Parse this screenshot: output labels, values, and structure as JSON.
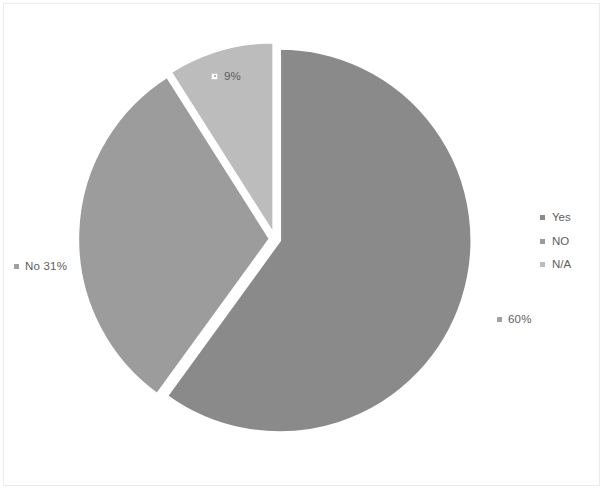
{
  "chart_data": {
    "type": "pie",
    "title": "",
    "categories": [
      "Yes",
      "NO",
      "N/A"
    ],
    "values": [
      60,
      31,
      9
    ],
    "value_unit": "%",
    "data_labels": [
      {
        "text": "60%",
        "category": "Yes",
        "marker": "solid",
        "position": "outside-right"
      },
      {
        "text": "No 31%",
        "category": "NO",
        "marker": "solid",
        "position": "outside-left"
      },
      {
        "text": "9%",
        "category": "N/A",
        "marker": "outline",
        "position": "inside-top"
      }
    ],
    "legend": {
      "position": "right",
      "entries": [
        {
          "label": "Yes",
          "color": "#8a8a8a"
        },
        {
          "label": "NO",
          "color": "#9c9c9c"
        },
        {
          "label": "N/A",
          "color": "#bcbcbc"
        }
      ]
    },
    "slice_colors": [
      "#8a8a8a",
      "#9c9c9c",
      "#bcbcbc"
    ],
    "start_angle": 0,
    "direction": "clockwise",
    "separator_color": "#ffffff",
    "grid": false
  },
  "labels": {
    "na": "9%",
    "no": "No 31%",
    "yes": "60%"
  },
  "legend": {
    "items": [
      {
        "label": "Yes"
      },
      {
        "label": "NO"
      },
      {
        "label": "N/A"
      }
    ]
  },
  "colors": {
    "yes": "#8a8a8a",
    "no": "#9c9c9c",
    "na": "#bcbcbc",
    "separator": "#ffffff",
    "text": "#5d5d5d",
    "frame": "#ebebeb",
    "marker": "#a0a0a0",
    "background": "#ffffff"
  }
}
